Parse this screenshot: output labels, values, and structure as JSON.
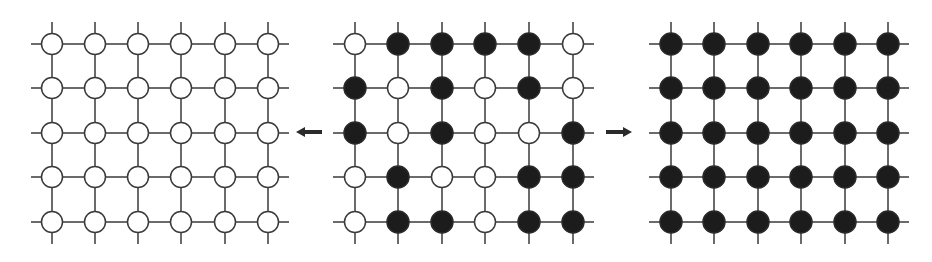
{
  "diagram": {
    "rows": 5,
    "cols": 6,
    "node_radius": 10.5,
    "colors": {
      "line": "#3a3a3a",
      "black_node": "#1c1c1c",
      "white_node": "#ffffff",
      "arrow": "#2a2a2a"
    },
    "row_y": [
      44,
      88,
      133,
      177,
      222
    ],
    "grids": [
      {
        "name": "left-grid-all-white",
        "col_x": [
          52,
          95,
          138,
          181,
          225,
          268
        ],
        "line_x_extent": [
          31,
          289
        ],
        "states": [
          "WWWWWW",
          "WWWWWW",
          "WWWWWW",
          "WWWWWW",
          "WWWWWW"
        ]
      },
      {
        "name": "middle-grid-mixed",
        "col_x": [
          355,
          398,
          442,
          485,
          529,
          573
        ],
        "line_x_extent": [
          333,
          594
        ],
        "states": [
          "WBBBBW",
          "BWBWBW",
          "BWBWWB",
          "WBWWBB",
          "WBBWBB"
        ]
      },
      {
        "name": "right-grid-all-black",
        "col_x": [
          671,
          714,
          758,
          801,
          845,
          888
        ],
        "line_x_extent": [
          649,
          909
        ],
        "states": [
          "BBBBBB",
          "BBBBBB",
          "BBBBBB",
          "BBBBBB",
          "BBBBBB"
        ]
      }
    ],
    "line_y_extent": [
      22,
      244
    ],
    "arrows": [
      {
        "name": "arrow-left",
        "direction": "left",
        "x1": 322,
        "x2": 296,
        "y": 132
      },
      {
        "name": "arrow-right",
        "direction": "right",
        "x1": 606,
        "x2": 632,
        "y": 132
      }
    ]
  }
}
